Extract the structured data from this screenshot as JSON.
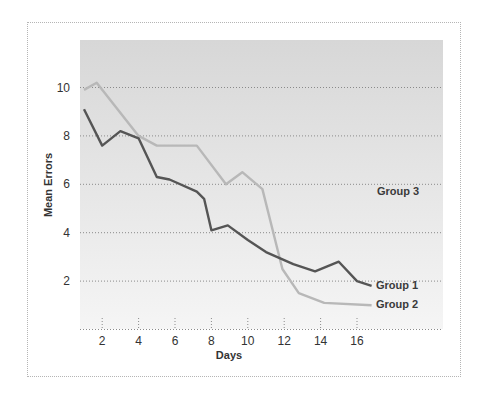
{
  "chart_data": {
    "type": "line",
    "title": "",
    "xlabel": "Days",
    "ylabel": "Mean Errors",
    "xlim": [
      1,
      17
    ],
    "ylim": [
      0,
      12
    ],
    "x_ticks": [
      2,
      4,
      6,
      8,
      10,
      12,
      14,
      16
    ],
    "y_ticks": [
      2,
      4,
      6,
      8,
      10
    ],
    "grid": "horizontal dotted",
    "legend": "inline labels at line ends",
    "series": [
      {
        "name": "Group 1",
        "color": "#555555",
        "x": [
          1,
          2,
          3,
          4,
          5,
          5.7,
          7.2,
          7.6,
          8,
          8.9,
          10,
          11,
          12.5,
          13.7,
          15,
          16,
          16.8
        ],
        "y": [
          9.1,
          7.6,
          8.2,
          7.9,
          6.3,
          6.2,
          5.7,
          5.4,
          4.1,
          4.3,
          3.7,
          3.2,
          2.7,
          2.4,
          2.8,
          2.0,
          1.8
        ]
      },
      {
        "name": "Group 2",
        "color": "#b8b8b8",
        "x": [
          1,
          1.7,
          4,
          5,
          6.1,
          7.2,
          8.8,
          9.7,
          10.8,
          11.9,
          12.8,
          14.2,
          16.8
        ],
        "y": [
          9.9,
          10.2,
          8.0,
          7.6,
          7.6,
          7.6,
          6.0,
          6.5,
          5.8,
          2.5,
          1.5,
          1.1,
          1.0
        ]
      },
      {
        "name": "Group 3",
        "color": "#f4f4f4",
        "x": [],
        "y": []
      }
    ]
  },
  "labels": {
    "y_title": "Mean Errors",
    "x_title": "Days",
    "group1": "Group 1",
    "group2": "Group 2",
    "group3": "Group 3",
    "y_ticks": [
      "2",
      "4",
      "6",
      "8",
      "10"
    ],
    "x_ticks": [
      "2",
      "4",
      "6",
      "8",
      "10",
      "12",
      "14",
      "16"
    ]
  }
}
